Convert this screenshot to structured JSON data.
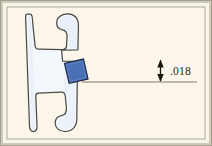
{
  "figure": {
    "type": "engineering-cross-section",
    "background_color": "#fbf6e9",
    "frame_outer_color": "#b9b3a2",
    "frame_inner_color": "#ffffff",
    "border_color": "#7c766a"
  },
  "profile": {
    "name": "extrusion-profile",
    "fill_color": "#f4f8fc",
    "stroke_color": "#4a4a46",
    "shade_color": "#dfe9f3",
    "description": "H-shaped gasket extrusion cross-section"
  },
  "highlight": {
    "name": "contact-area",
    "label": "",
    "fill_color": "#4a6fb5",
    "stroke_color": "#1a2a4a",
    "rotation_deg": -13
  },
  "dimension": {
    "name": "thickness-dimension",
    "value": ".018",
    "units": "",
    "leader_color": "#6b5a4a",
    "arrow_color": "#1a1a18",
    "text_color": "#2a2a28",
    "top_leader_y": 59,
    "bottom_leader_y": 82,
    "arrow_x": 160,
    "text_x": 170,
    "text_y": 75
  },
  "annotations": {
    "dimension_label": ".018"
  }
}
